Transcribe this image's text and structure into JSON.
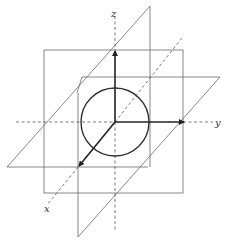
{
  "diagram": {
    "axes": {
      "x": {
        "label": "x"
      },
      "y": {
        "label": "y"
      },
      "z": {
        "label": "z"
      }
    },
    "colors": {
      "plane_lines": "#6a6a6a",
      "axis_arrows": "#222222",
      "circle": "#333333",
      "background": "#ffffff"
    },
    "elements": [
      "frontal-square-plane",
      "horizontal-parallelogram-plane",
      "slanted-vertical-plane",
      "circle-at-origin",
      "x-axis-arrow",
      "y-axis-arrow",
      "z-axis-arrow"
    ]
  }
}
